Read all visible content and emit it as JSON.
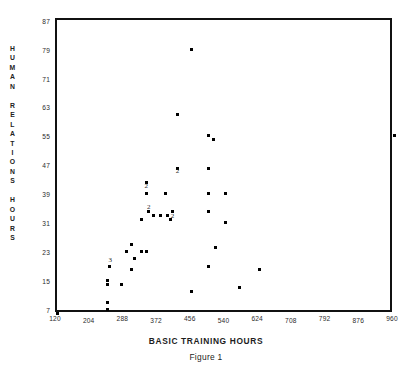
{
  "header": {
    "clipped_text": "DISTRIBUTION OF BASIC TRAINING AND HUMAN RELATIONS HOURS"
  },
  "axes": {
    "x_title": "BASIC TRAINING HOURS",
    "y_title_letters": [
      "H",
      "U",
      "M",
      "A",
      "N",
      "",
      "R",
      "E",
      "L",
      "A",
      "T",
      "I",
      "O",
      "N",
      "S",
      "",
      "H",
      "O",
      "U",
      "R",
      "S"
    ],
    "x_ticks": [
      "120",
      "204",
      "288",
      "372",
      "456",
      "540",
      "624",
      "708",
      "792",
      "876",
      "960"
    ],
    "y_ticks": [
      "87",
      "79",
      "71",
      "63",
      "55",
      "47",
      "39",
      "31",
      "23",
      "15",
      "7"
    ]
  },
  "caption": "Figure 1",
  "chart_data": {
    "type": "scatter",
    "title": "",
    "xlabel": "BASIC TRAINING HOURS",
    "ylabel": "HUMAN RELATIONS HOURS",
    "xlim": [
      120,
      960
    ],
    "ylim": [
      7,
      87
    ],
    "xticks": [
      120,
      204,
      288,
      372,
      456,
      540,
      624,
      708,
      792,
      876,
      960
    ],
    "yticks": [
      7,
      15,
      23,
      31,
      39,
      47,
      55,
      63,
      71,
      79,
      87
    ],
    "grid": false,
    "legend": null,
    "marker": "square-dot",
    "points": [
      {
        "x": 120,
        "y": 7,
        "count": 1
      },
      {
        "x": 456,
        "y": 80,
        "count": 1
      },
      {
        "x": 420,
        "y": 62,
        "count": 1
      },
      {
        "x": 498,
        "y": 56,
        "count": 1
      },
      {
        "x": 510,
        "y": 55,
        "count": 1
      },
      {
        "x": 960,
        "y": 56,
        "count": 1
      },
      {
        "x": 420,
        "y": 47,
        "count": 1,
        "label": "2",
        "label_dx": 0,
        "label_dy": 9
      },
      {
        "x": 498,
        "y": 47,
        "count": 1
      },
      {
        "x": 342,
        "y": 43,
        "count": 1
      },
      {
        "x": 342,
        "y": 40,
        "count": 2,
        "label": "2",
        "label_dx": 0,
        "label_dy": -1
      },
      {
        "x": 390,
        "y": 40,
        "count": 1
      },
      {
        "x": 498,
        "y": 40,
        "count": 1
      },
      {
        "x": 540,
        "y": 40,
        "count": 1
      },
      {
        "x": 348,
        "y": 35,
        "count": 2,
        "label": "2",
        "label_dx": 0,
        "label_dy": 2
      },
      {
        "x": 360,
        "y": 34,
        "count": 1
      },
      {
        "x": 378,
        "y": 34,
        "count": 1
      },
      {
        "x": 396,
        "y": 34,
        "count": 1
      },
      {
        "x": 408,
        "y": 35,
        "count": 1
      },
      {
        "x": 498,
        "y": 35,
        "count": 1
      },
      {
        "x": 402,
        "y": 33,
        "count": 2,
        "label": "2",
        "label_dx": 2,
        "label_dy": 3
      },
      {
        "x": 330,
        "y": 33,
        "count": 1
      },
      {
        "x": 540,
        "y": 32,
        "count": 1
      },
      {
        "x": 306,
        "y": 26,
        "count": 1
      },
      {
        "x": 294,
        "y": 24,
        "count": 1
      },
      {
        "x": 330,
        "y": 24,
        "count": 1
      },
      {
        "x": 342,
        "y": 24,
        "count": 1
      },
      {
        "x": 516,
        "y": 25,
        "count": 1
      },
      {
        "x": 312,
        "y": 22,
        "count": 1
      },
      {
        "x": 252,
        "y": 20,
        "count": 3,
        "label": "3",
        "label_dx": 0,
        "label_dy": 0
      },
      {
        "x": 498,
        "y": 20,
        "count": 1
      },
      {
        "x": 624,
        "y": 19,
        "count": 1
      },
      {
        "x": 306,
        "y": 19,
        "count": 1
      },
      {
        "x": 246,
        "y": 16,
        "count": 1
      },
      {
        "x": 246,
        "y": 15,
        "count": 1
      },
      {
        "x": 282,
        "y": 15,
        "count": 1
      },
      {
        "x": 576,
        "y": 14,
        "count": 1
      },
      {
        "x": 456,
        "y": 13,
        "count": 1
      },
      {
        "x": 246,
        "y": 10,
        "count": 1
      },
      {
        "x": 246,
        "y": 8,
        "count": 1
      }
    ]
  }
}
